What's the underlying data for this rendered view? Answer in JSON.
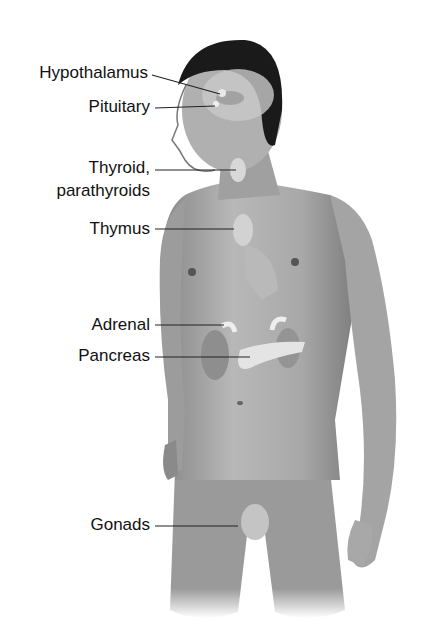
{
  "diagram": {
    "labels": [
      {
        "id": "hypothalamus",
        "text": "Hypothalamus"
      },
      {
        "id": "pituitary",
        "text": "Pituitary"
      },
      {
        "id": "thyroid_line1",
        "text": "Thyroid,"
      },
      {
        "id": "thyroid_line2",
        "text": "parathyroids"
      },
      {
        "id": "thymus",
        "text": "Thymus"
      },
      {
        "id": "adrenal",
        "text": "Adrenal"
      },
      {
        "id": "pancreas",
        "text": "Pancreas"
      },
      {
        "id": "gonads",
        "text": "Gonads"
      }
    ]
  }
}
